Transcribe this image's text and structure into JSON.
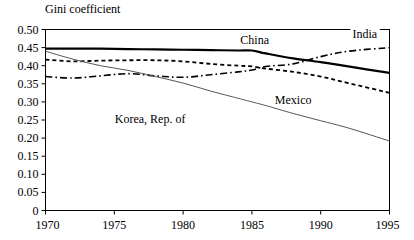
{
  "chart_data": {
    "type": "line",
    "title": "Gini coefficient",
    "xlabel": "",
    "ylabel": "Gini coefficient",
    "xlim": [
      1970,
      1995
    ],
    "ylim": [
      0,
      0.5
    ],
    "grid": false,
    "legend_position": "inline-labels",
    "x_ticks": [
      "1970",
      "1975",
      "1980",
      "1985",
      "1990",
      "1995"
    ],
    "x_tick_values": [
      1970,
      1975,
      1980,
      1985,
      1990,
      1995
    ],
    "y_ticks": [
      "0",
      "0.05",
      "0.10",
      "0.15",
      "0.20",
      "0.25",
      "0.30",
      "0.35",
      "0.40",
      "0.45",
      "0.50"
    ],
    "y_tick_values": [
      0,
      0.05,
      0.1,
      0.15,
      0.2,
      0.25,
      0.3,
      0.35,
      0.4,
      0.45,
      0.5
    ],
    "x": [
      1970,
      1972,
      1974,
      1976,
      1978,
      1980,
      1982,
      1984,
      1985,
      1986,
      1988,
      1990,
      1992,
      1995
    ],
    "series": [
      {
        "name": "China",
        "style": "solid-thick",
        "color": "#000000",
        "label_x": 1985.2,
        "label_y": 0.472,
        "values": [
          0.447,
          0.447,
          0.447,
          0.446,
          0.445,
          0.444,
          0.443,
          0.442,
          0.442,
          0.434,
          0.42,
          0.41,
          0.398,
          0.38
        ]
      },
      {
        "name": "Mexico",
        "style": "dashed",
        "color": "#000000",
        "label_x": 1988.0,
        "label_y": 0.305,
        "values": [
          0.417,
          0.412,
          0.414,
          0.415,
          0.415,
          0.412,
          0.405,
          0.4,
          0.398,
          0.392,
          0.383,
          0.37,
          0.352,
          0.325
        ]
      },
      {
        "name": "India",
        "style": "dash-dot",
        "color": "#000000",
        "label_x": 1993.2,
        "label_y": 0.488,
        "values": [
          0.37,
          0.366,
          0.372,
          0.378,
          0.372,
          0.368,
          0.375,
          0.383,
          0.388,
          0.398,
          0.405,
          0.425,
          0.44,
          0.45
        ]
      },
      {
        "name": "Korea, Rep. of",
        "style": "solid-thin",
        "color": "#555555",
        "label_x": 1977.6,
        "label_y": 0.252,
        "values": [
          0.44,
          0.418,
          0.4,
          0.387,
          0.37,
          0.352,
          0.33,
          0.31,
          0.3,
          0.29,
          0.268,
          0.248,
          0.228,
          0.192
        ]
      }
    ]
  }
}
